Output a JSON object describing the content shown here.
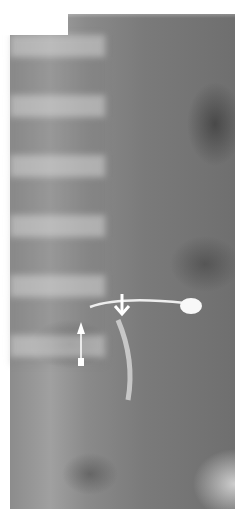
{
  "image": {
    "type": "radiograph",
    "description": "Abdominal X-ray with lumbar spine and catheter/stent with balloon tip",
    "annotations": [
      {
        "name": "arrow-down",
        "direction": "down",
        "position": [
          122,
          296
        ]
      },
      {
        "name": "arrow-up",
        "direction": "up",
        "position": [
          80,
          340
        ]
      }
    ],
    "colors": {
      "background": "#ffffff",
      "film": "#7f7f7f"
    }
  }
}
